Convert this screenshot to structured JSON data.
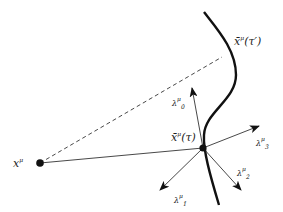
{
  "diagram": {
    "title": "",
    "labels": {
      "x_point": {
        "base": "x",
        "sup": "μ"
      },
      "worldline_later": {
        "base": "x̄",
        "sup": "μ",
        "arg": "(τ′)"
      },
      "worldline_point": {
        "base": "x̄",
        "sup": "μ",
        "arg": "(τ)"
      },
      "tetrad_0": {
        "base": "λ",
        "sup": "μ",
        "sub": "0̂"
      },
      "tetrad_1": {
        "base": "λ",
        "sup": "μ",
        "sub": "1̂"
      },
      "tetrad_2": {
        "base": "λ",
        "sup": "μ",
        "sub": "2̂"
      },
      "tetrad_3": {
        "base": "λ",
        "sup": "μ",
        "sub": "3̂"
      }
    },
    "elements": [
      "worldline curve",
      "dashed line from x^μ to x̄^μ(τ′)",
      "solid line from x^μ to x̄^μ(τ)",
      "four tetrad arrows from x̄^μ(τ)"
    ],
    "colors": {
      "ink": "#111111",
      "thin": "#333333"
    }
  }
}
